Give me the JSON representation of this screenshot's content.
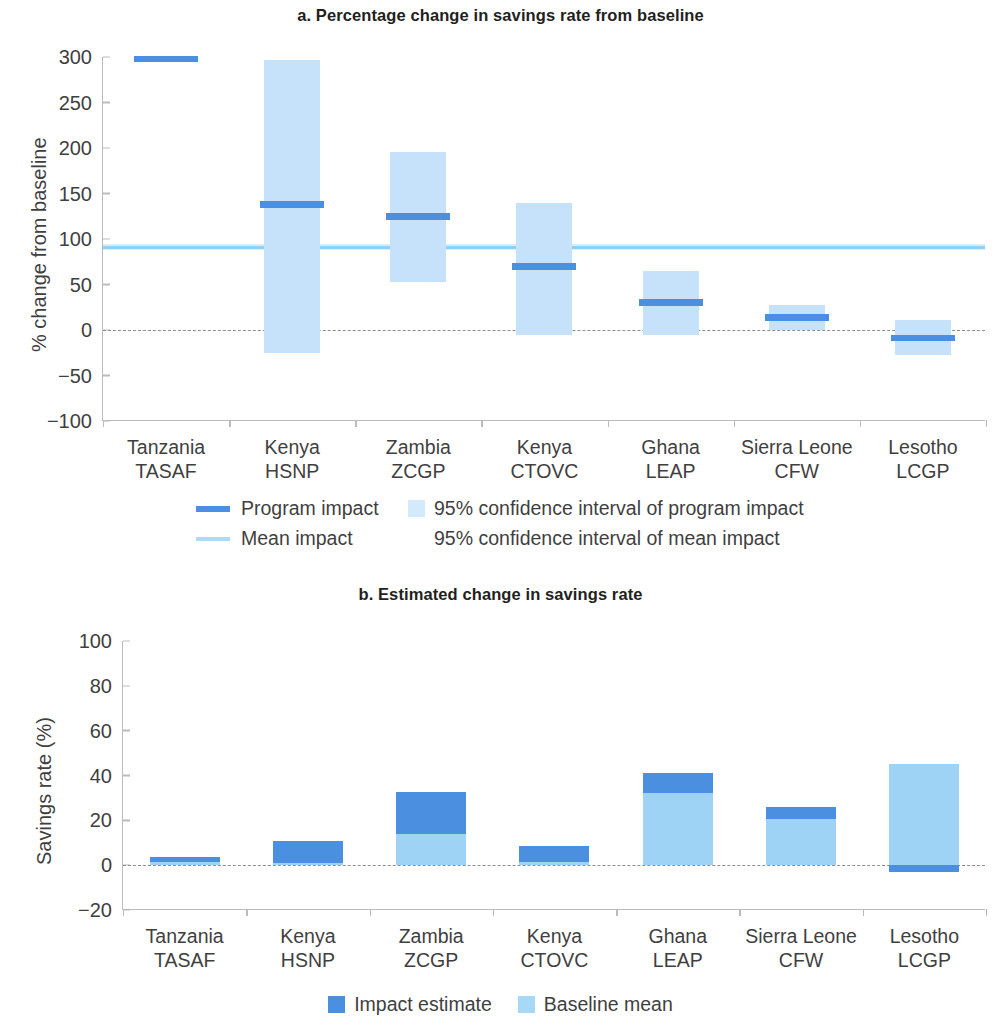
{
  "colors": {
    "impact_dark_blue": "#4a8fe0",
    "ci_light_blue": "#c6e2fa",
    "baseline_light_blue": "#9ed3f5",
    "mean_line_blue": "#8ed2f4",
    "axis_gray": "#b9bbbd",
    "text_gray": "#3f3f3f"
  },
  "panel_a": {
    "title": "a. Percentage change in savings rate from baseline",
    "ylabel": "% change from baseline",
    "yticks": [
      "300",
      "250",
      "200",
      "150",
      "100",
      "50",
      "0",
      "−50",
      "−100"
    ],
    "legend": {
      "program_impact": "Program impact",
      "ci_program_impact": "95% confidence interval of program impact",
      "mean_impact": "Mean impact",
      "ci_mean_impact": "95% confidence interval of mean impact"
    }
  },
  "panel_b": {
    "title": "b. Estimated change in savings rate",
    "ylabel": "Savings rate (%)",
    "yticks": [
      "100",
      "80",
      "60",
      "40",
      "20",
      "0",
      "−20"
    ],
    "legend": {
      "impact_estimate": "Impact estimate",
      "baseline_mean": "Baseline mean"
    }
  },
  "chart_data": [
    {
      "type": "bar",
      "title": "a. Percentage change in savings rate from baseline",
      "xlabel": "",
      "ylabel": "% change from baseline",
      "ylim": [
        -100,
        300
      ],
      "yticks": [
        -100,
        -50,
        0,
        50,
        100,
        150,
        200,
        250,
        300
      ],
      "grid": false,
      "zero_reference_line": 0,
      "mean_impact": 91,
      "mean_impact_ci": [
        88,
        94
      ],
      "legend_position": "below-plot",
      "categories": [
        "Tanzania TASAF",
        "Kenya HSNP",
        "Zambia ZCGP",
        "Kenya CTOVC",
        "Ghana LEAP",
        "Sierra Leone CFW",
        "Lesotho LCGP"
      ],
      "category_lines": [
        [
          "Tanzania",
          "TASAF"
        ],
        [
          "Kenya",
          "HSNP"
        ],
        [
          "Zambia",
          "ZCGP"
        ],
        [
          "Kenya",
          "CTOVC"
        ],
        [
          "Ghana",
          "LEAP"
        ],
        [
          "Sierra Leone",
          "CFW"
        ],
        [
          "Lesotho",
          "LCGP"
        ]
      ],
      "series": [
        {
          "name": "Program impact",
          "values": [
            298,
            138,
            125,
            70,
            30,
            14,
            -9
          ]
        },
        {
          "name": "95% confidence interval of program impact",
          "lower": [
            298,
            -25,
            53,
            -5,
            -6,
            0,
            -28
          ],
          "upper": [
            298,
            297,
            196,
            140,
            65,
            28,
            11
          ]
        }
      ]
    },
    {
      "type": "bar",
      "title": "b. Estimated change in savings rate",
      "xlabel": "",
      "ylabel": "Savings rate (%)",
      "ylim": [
        -20,
        100
      ],
      "yticks": [
        -20,
        0,
        20,
        40,
        60,
        80,
        100
      ],
      "grid": false,
      "zero_reference_line": 0,
      "stacked": true,
      "legend_position": "below-plot",
      "categories": [
        "Tanzania TASAF",
        "Kenya HSNP",
        "Zambia ZCGP",
        "Kenya CTOVC",
        "Ghana LEAP",
        "Sierra Leone CFW",
        "Lesotho LCGP"
      ],
      "category_lines": [
        [
          "Tanzania",
          "TASAF"
        ],
        [
          "Kenya",
          "HSNP"
        ],
        [
          "Zambia",
          "ZCGP"
        ],
        [
          "Kenya",
          "CTOVC"
        ],
        [
          "Ghana",
          "LEAP"
        ],
        [
          "Sierra Leone",
          "CFW"
        ],
        [
          "Lesotho",
          "LCGP"
        ]
      ],
      "series": [
        {
          "name": "Baseline mean",
          "values": [
            1.2,
            1.0,
            14.0,
            1.5,
            32.0,
            20.5,
            45.0
          ]
        },
        {
          "name": "Impact estimate",
          "values": [
            2.3,
            10.0,
            18.5,
            7.0,
            9.0,
            5.5,
            -3.0
          ]
        }
      ]
    }
  ]
}
